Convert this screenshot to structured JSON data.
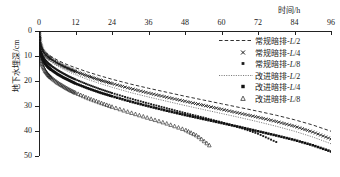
{
  "chart_data": {
    "type": "line",
    "title": "",
    "xlabel": "时间/h",
    "ylabel": "地下水埋深/cm",
    "xlim": [
      0,
      96
    ],
    "ylim": [
      0,
      50
    ],
    "y_inverted": true,
    "grid": false,
    "legend_position": "top-right",
    "xticks": [
      "0",
      "12",
      "24",
      "36",
      "48",
      "60",
      "72",
      "84",
      "96"
    ],
    "xtick_values": [
      0,
      12,
      24,
      36,
      48,
      60,
      72,
      84,
      96
    ],
    "yticks": [
      "0",
      "10",
      "20",
      "30",
      "40",
      "50"
    ],
    "ytick_values": [
      0,
      10,
      20,
      30,
      40,
      50
    ],
    "series": [
      {
        "name": "常规暗排-L/2",
        "name_prefix": "常规暗排-",
        "name_italic": "L",
        "name_suffix": "/2",
        "style": "dashed-line",
        "color": "#1a1a1a",
        "x": [
          0,
          0.5,
          1,
          2,
          3,
          4,
          6,
          8,
          10,
          12,
          16,
          20,
          24,
          30,
          36,
          42,
          48,
          54,
          60,
          66,
          72,
          78,
          84,
          90,
          96
        ],
        "y": [
          0,
          5.0,
          6.8,
          8.4,
          9.4,
          10.2,
          11.6,
          12.8,
          13.8,
          14.7,
          16.4,
          17.9,
          19.3,
          21.2,
          22.9,
          24.5,
          26.1,
          27.6,
          29.1,
          30.6,
          32.1,
          33.7,
          35.5,
          37.6,
          40.1
        ]
      },
      {
        "name": "常规暗排-L/4",
        "name_prefix": "常规暗排-",
        "name_italic": "L",
        "name_suffix": "/4",
        "style": "cross-marker",
        "color": "#1a1a1a",
        "x": [
          0,
          0.5,
          1,
          2,
          3,
          4,
          6,
          8,
          10,
          12,
          16,
          20,
          24,
          30,
          36,
          42,
          48,
          54,
          60,
          66,
          72,
          78,
          84,
          90,
          96
        ],
        "y": [
          0,
          5.6,
          7.6,
          9.3,
          10.4,
          11.3,
          12.8,
          14.1,
          15.2,
          16.2,
          18.0,
          19.6,
          21.0,
          23.0,
          24.8,
          26.5,
          28.1,
          29.7,
          31.3,
          32.9,
          34.5,
          36.2,
          38.1,
          40.4,
          43.2
        ]
      },
      {
        "name": "常规暗排-L/8",
        "name_prefix": "常规暗排-",
        "name_italic": "L",
        "name_suffix": "/8",
        "style": "small-square-marker",
        "color": "#1a1a1a",
        "x": [
          0,
          0.5,
          1,
          2,
          3,
          4,
          6,
          8,
          10,
          12,
          16,
          20,
          24,
          30,
          36,
          42,
          48,
          54,
          60,
          66,
          72,
          78
        ],
        "y": [
          0,
          7.4,
          9.6,
          11.6,
          12.9,
          13.9,
          15.6,
          17.0,
          18.3,
          19.4,
          21.4,
          23.2,
          24.8,
          27.0,
          29.0,
          30.9,
          32.8,
          34.6,
          36.5,
          38.6,
          41.1,
          44.4
        ]
      },
      {
        "name": "改进暗排-L/2",
        "name_prefix": "改进暗排-",
        "name_italic": "L",
        "name_suffix": "/2",
        "style": "dotted-line",
        "color": "#6d6d6d",
        "x": [
          0,
          0.5,
          1,
          2,
          3,
          4,
          6,
          8,
          10,
          12,
          16,
          20,
          24,
          30,
          36,
          42,
          48,
          54,
          60,
          66,
          72,
          78,
          84,
          90,
          96
        ],
        "y": [
          0,
          6.2,
          8.4,
          10.3,
          11.5,
          12.4,
          14.0,
          15.3,
          16.5,
          17.5,
          19.4,
          21.0,
          22.5,
          24.6,
          26.4,
          28.1,
          29.8,
          31.4,
          33.0,
          34.6,
          36.3,
          38.1,
          40.1,
          42.4,
          45.1
        ]
      },
      {
        "name": "改进暗排-L/4",
        "name_prefix": "改进暗排-",
        "name_italic": "L",
        "name_suffix": "/4",
        "style": "filled-square-marker",
        "color": "#111111",
        "x": [
          0,
          0.5,
          1,
          2,
          3,
          4,
          6,
          8,
          10,
          12,
          16,
          20,
          24,
          30,
          36,
          42,
          48,
          54,
          60,
          66,
          72,
          78,
          84,
          90,
          96
        ],
        "y": [
          0,
          8.6,
          11.0,
          13.1,
          14.5,
          15.5,
          17.2,
          18.6,
          19.8,
          21.0,
          22.9,
          24.6,
          26.1,
          28.2,
          30.1,
          31.9,
          33.6,
          35.2,
          36.8,
          38.4,
          40.1,
          41.8,
          43.6,
          45.7,
          48.2
        ]
      },
      {
        "name": "改进暗排-L/8",
        "name_prefix": "改进暗排-",
        "name_italic": "L",
        "name_suffix": "/8",
        "style": "triangle-marker",
        "color": "#1a1a1a",
        "x": [
          0,
          0.5,
          1,
          2,
          3,
          4,
          6,
          8,
          10,
          12,
          16,
          20,
          24,
          30,
          36,
          42,
          48,
          52,
          56
        ],
        "y": [
          0,
          10.6,
          13.4,
          15.9,
          17.5,
          18.7,
          20.6,
          22.1,
          23.5,
          24.7,
          26.8,
          28.6,
          30.3,
          32.6,
          34.8,
          37.0,
          39.5,
          41.9,
          45.7
        ]
      }
    ]
  }
}
